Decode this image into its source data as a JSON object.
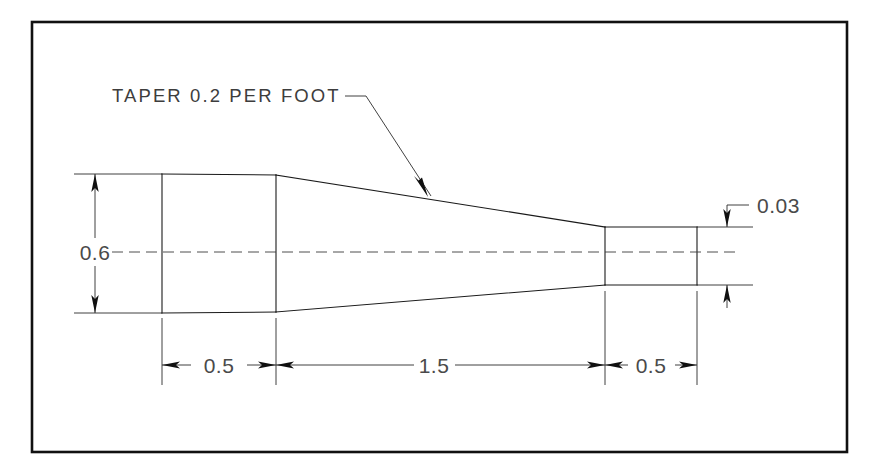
{
  "drawing": {
    "type": "mechanical-part-detail-drawing",
    "title": "Tapered Shaft Detail",
    "background_color": "#ffffff",
    "line_color": "#1a1a1a",
    "text_color": "#4a4a4a",
    "border": {
      "name": "drawing-frame",
      "x": 32,
      "y": 22,
      "width": 815,
      "height": 430
    },
    "notes": [
      {
        "id": "taper-note",
        "text": "TAPER 0.2 PER FOOT",
        "x": 112,
        "y": 102,
        "leader": {
          "from_x": 345,
          "from_y": 96,
          "elbow_x": 362,
          "elbow_y": 96,
          "to_x": 428,
          "to_y": 196
        }
      }
    ],
    "dimensions": [
      {
        "id": "dim-height-left",
        "value": "0.6",
        "orientation": "vertical",
        "text_x": 95,
        "text_y": 252,
        "line_x": 95,
        "from_y": 174,
        "to_y": 313,
        "measures": "large end diameter"
      },
      {
        "id": "dim-height-right",
        "value": "0.03",
        "orientation": "vertical",
        "text_x": 760,
        "text_y": 212,
        "line_x": 727,
        "from_y": 227,
        "to_y": 285,
        "measures": "small end step height",
        "placement": "outside"
      },
      {
        "id": "dim-length-left",
        "value": "0.5",
        "orientation": "horizontal",
        "text_x": 219,
        "text_y": 365,
        "line_y": 365,
        "from_x": 162,
        "to_x": 276,
        "measures": "left cylindrical section length"
      },
      {
        "id": "dim-length-middle",
        "value": "1.5",
        "orientation": "horizontal",
        "text_x": 434,
        "text_y": 365,
        "line_y": 365,
        "from_x": 276,
        "to_x": 605,
        "measures": "tapered section length"
      },
      {
        "id": "dim-length-right",
        "value": "0.5",
        "orientation": "horizontal",
        "text_x": 651,
        "text_y": 365,
        "line_y": 365,
        "from_x": 605,
        "to_x": 697,
        "measures": "right cylindrical section length"
      }
    ],
    "profile": {
      "name": "part-outline",
      "left_face_x": 162,
      "shoulder_x": 276,
      "taper_end_x": 605,
      "right_face_x": 697,
      "top_left_y": 174,
      "bottom_left_y": 313,
      "top_right_y": 227,
      "bottom_right_y": 285,
      "centerline_y": 252
    },
    "centerline": {
      "name": "axis-centerline",
      "from_x": 112,
      "to_x": 740,
      "y": 252
    }
  }
}
